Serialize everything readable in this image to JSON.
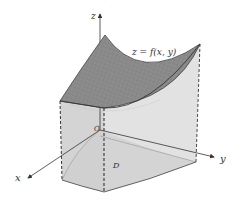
{
  "figure": {
    "type": "3d-surface-volume-diagram",
    "labels": {
      "z_axis": "z",
      "x_axis": "x",
      "y_axis": "y",
      "surface": "z = f(x, y)",
      "origin": "O",
      "region": "D"
    },
    "colors": {
      "surface": "#8a8a8a",
      "side_walls": "#dcdcdc",
      "base": "#c8c8c8",
      "axes": "#333333",
      "edges": "#444444"
    }
  }
}
